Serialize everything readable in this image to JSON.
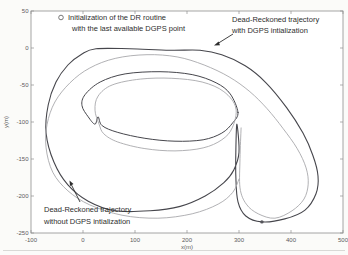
{
  "figure": {
    "legend": {
      "line1": "Initialization of the DR routine",
      "line2": "with the last available DGPS point"
    },
    "annotation_with": {
      "line1": "Dead-Reckoned trajectory",
      "line2": "with DGPS intialization"
    },
    "annotation_without": {
      "line1": "Dead-Reckoned trajectory",
      "line2": "without DGPS intialization"
    },
    "axes": {
      "xlabel": "x(m)",
      "ylabel": "y(m)"
    }
  },
  "colors": {
    "with_dgps": "#46464c",
    "without_dgps": "#a8a8ab",
    "frame": "#8f8f8f",
    "marker": "#55555a",
    "legend_circle": "#6a6a6a",
    "annotation_text": "#2d2d2d",
    "scan_line": "#d9d9d6",
    "plot_bg": "#ffffff"
  },
  "chart_data": {
    "type": "line",
    "title": "",
    "xlabel": "x(m)",
    "ylabel": "y(m)",
    "xlim": [
      -100,
      500
    ],
    "ylim": [
      -250,
      50
    ],
    "x_ticks": [
      -100,
      0,
      100,
      200,
      300,
      400,
      500
    ],
    "y_ticks": [
      50,
      0,
      -50,
      -100,
      -150,
      -200,
      -250
    ],
    "grid": false,
    "legend_marker_note": "o = Initialization of the DR routine with the last available DGPS point",
    "init_point": [
      344,
      -235
    ],
    "series": [
      {
        "name": "Dead-Reckoned trajectory with DGPS intialization (outer lap + turnaround loop)",
        "color": "#46464c",
        "width": 1.1,
        "closed": true,
        "points": [
          [
            25,
            -1
          ],
          [
            90,
            -1
          ],
          [
            167,
            -3
          ],
          [
            225,
            -3
          ],
          [
            267,
            -9
          ],
          [
            312,
            -24
          ],
          [
            352,
            -47
          ],
          [
            392,
            -81
          ],
          [
            423,
            -115
          ],
          [
            442,
            -145
          ],
          [
            452,
            -173
          ],
          [
            448,
            -197
          ],
          [
            427,
            -219
          ],
          [
            388,
            -231
          ],
          [
            344,
            -235
          ],
          [
            313,
            -227
          ],
          [
            298,
            -208
          ],
          [
            294,
            -176
          ],
          [
            294,
            -135
          ],
          [
            296,
            -103
          ],
          [
            300,
            -141
          ],
          [
            290,
            -165
          ],
          [
            271,
            -182
          ],
          [
            235,
            -200
          ],
          [
            187,
            -214
          ],
          [
            129,
            -220
          ],
          [
            62,
            -220
          ],
          [
            10,
            -207
          ],
          [
            -29,
            -185
          ],
          [
            -56,
            -154
          ],
          [
            -71,
            -115
          ],
          [
            -67,
            -77
          ],
          [
            -52,
            -46
          ],
          [
            -29,
            -23
          ],
          [
            -2,
            -8
          ]
        ]
      },
      {
        "name": "Dead-Reckoned trajectory with DGPS intialization (inner lap, notch at re-init)",
        "color": "#46464c",
        "width": 1.0,
        "closed": true,
        "points": [
          [
            298,
            -87
          ],
          [
            283,
            -62
          ],
          [
            256,
            -47
          ],
          [
            210,
            -36
          ],
          [
            148,
            -32
          ],
          [
            81,
            -35
          ],
          [
            33,
            -46
          ],
          [
            4,
            -63
          ],
          [
            -2,
            -78
          ],
          [
            10,
            -93
          ],
          [
            23,
            -103
          ],
          [
            29,
            -93
          ],
          [
            37,
            -105
          ],
          [
            67,
            -114
          ],
          [
            119,
            -122
          ],
          [
            177,
            -126
          ],
          [
            231,
            -124
          ],
          [
            267,
            -115
          ],
          [
            288,
            -101
          ]
        ]
      },
      {
        "name": "Dead-Reckoned trajectory without DGPS intialization (outer lap)",
        "color": "#a8a8ab",
        "width": 0.9,
        "closed": false,
        "points": [
          [
            304,
            -108
          ],
          [
            302,
            -149
          ],
          [
            302,
            -189
          ],
          [
            314,
            -211
          ],
          [
            337,
            -224
          ],
          [
            369,
            -230
          ],
          [
            402,
            -220
          ],
          [
            425,
            -204
          ],
          [
            433,
            -184
          ],
          [
            429,
            -162
          ],
          [
            412,
            -136
          ],
          [
            385,
            -109
          ],
          [
            354,
            -82
          ],
          [
            321,
            -59
          ],
          [
            281,
            -39
          ],
          [
            233,
            -23
          ],
          [
            181,
            -12
          ],
          [
            123,
            -9
          ],
          [
            62,
            -14
          ],
          [
            13,
            -27
          ],
          [
            -25,
            -47
          ],
          [
            -54,
            -73
          ],
          [
            -69,
            -103
          ],
          [
            -71,
            -135
          ],
          [
            -58,
            -168
          ],
          [
            -29,
            -193
          ],
          [
            13,
            -212
          ],
          [
            75,
            -226
          ],
          [
            144,
            -230
          ],
          [
            210,
            -224
          ],
          [
            260,
            -211
          ],
          [
            288,
            -195
          ],
          [
            300,
            -177
          ]
        ]
      },
      {
        "name": "Dead-Reckoned trajectory without DGPS intialization (inner lap)",
        "color": "#a8a8ab",
        "width": 0.9,
        "closed": true,
        "points": [
          [
            294,
            -81
          ],
          [
            271,
            -59
          ],
          [
            229,
            -46
          ],
          [
            171,
            -41
          ],
          [
            110,
            -42
          ],
          [
            56,
            -50
          ],
          [
            29,
            -65
          ],
          [
            23,
            -84
          ],
          [
            31,
            -103
          ],
          [
            40,
            -116
          ],
          [
            67,
            -127
          ],
          [
            119,
            -136
          ],
          [
            177,
            -139
          ],
          [
            231,
            -135
          ],
          [
            267,
            -124
          ],
          [
            287,
            -108
          ]
        ]
      }
    ]
  }
}
